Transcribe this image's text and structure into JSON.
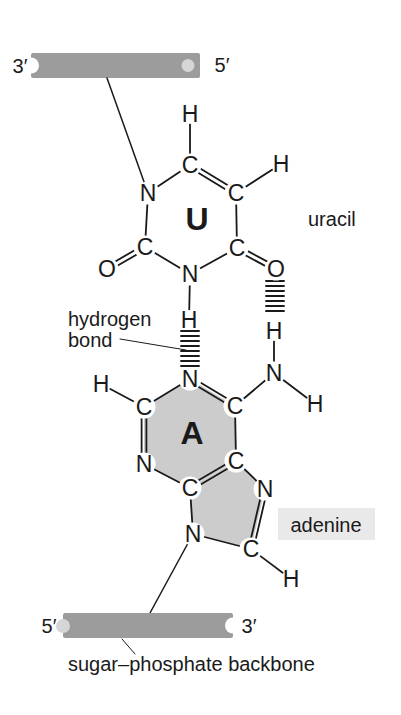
{
  "colors": {
    "line": "#1a1a1a",
    "text": "#1a1a1a",
    "backbone": "#9c9c9c",
    "backbone_socket": "#d6d6d6",
    "ring_fill": "#cccccc",
    "label_bg": "#e9e9e9"
  },
  "backbones": {
    "top": {
      "left_end": "3′",
      "right_end": "5′"
    },
    "bottom": {
      "left_end": "5′",
      "right_end": "3′"
    },
    "caption": "sugar–phosphate backbone"
  },
  "annotations": {
    "uracil_label": "uracil",
    "adenine_label": "adenine",
    "hbond_label_line1": "hydrogen",
    "hbond_label_line2": "bond"
  },
  "molecule": {
    "atoms": [
      {
        "id": "u-h5",
        "el": "H",
        "x": 190,
        "y": 114
      },
      {
        "id": "u-c5",
        "el": "C",
        "x": 190,
        "y": 165
      },
      {
        "id": "u-h6",
        "el": "H",
        "x": 281,
        "y": 164
      },
      {
        "id": "u-c6",
        "el": "C",
        "x": 236,
        "y": 193
      },
      {
        "id": "u-n1",
        "el": "N",
        "x": 148,
        "y": 193
      },
      {
        "id": "u-c2",
        "el": "C",
        "x": 145,
        "y": 247
      },
      {
        "id": "u-o2",
        "el": "O",
        "x": 107,
        "y": 269
      },
      {
        "id": "u-n3",
        "el": "N",
        "x": 190,
        "y": 274
      },
      {
        "id": "u-c4",
        "el": "C",
        "x": 237,
        "y": 248
      },
      {
        "id": "u-o4",
        "el": "O",
        "x": 276,
        "y": 269
      },
      {
        "id": "u-h3",
        "el": "H",
        "x": 189,
        "y": 320
      },
      {
        "id": "a-ha",
        "el": "H",
        "x": 274,
        "y": 331
      },
      {
        "id": "a-n6",
        "el": "N",
        "x": 274,
        "y": 373
      },
      {
        "id": "a-hb",
        "el": "H",
        "x": 315,
        "y": 404
      },
      {
        "id": "a-n1",
        "el": "N",
        "x": 190,
        "y": 379
      },
      {
        "id": "a-h2",
        "el": "H",
        "x": 101,
        "y": 384
      },
      {
        "id": "a-c2",
        "el": "C",
        "x": 144,
        "y": 407
      },
      {
        "id": "a-c6",
        "el": "C",
        "x": 235,
        "y": 406
      },
      {
        "id": "a-n3",
        "el": "N",
        "x": 144,
        "y": 464
      },
      {
        "id": "a-c5",
        "el": "C",
        "x": 236,
        "y": 461
      },
      {
        "id": "a-c4",
        "el": "C",
        "x": 190,
        "y": 488
      },
      {
        "id": "a-n7",
        "el": "N",
        "x": 265,
        "y": 489
      },
      {
        "id": "a-n9",
        "el": "N",
        "x": 193,
        "y": 534
      },
      {
        "id": "a-c8",
        "el": "C",
        "x": 251,
        "y": 549
      },
      {
        "id": "a-h8",
        "el": "H",
        "x": 291,
        "y": 579
      }
    ],
    "bonds": [
      [
        "u-c5",
        "u-h5",
        "s"
      ],
      [
        "u-n1",
        "u-c5",
        "s"
      ],
      [
        "u-c5",
        "u-c6",
        "d"
      ],
      [
        "u-c6",
        "u-h6",
        "s"
      ],
      [
        "u-c6",
        "u-c4",
        "s"
      ],
      [
        "u-c4",
        "u-n3",
        "s"
      ],
      [
        "u-n3",
        "u-c2",
        "s"
      ],
      [
        "u-c2",
        "u-n1",
        "s"
      ],
      [
        "u-c2",
        "u-o2",
        "d"
      ],
      [
        "u-c4",
        "u-o4",
        "d"
      ],
      [
        "u-n3",
        "u-h3",
        "s"
      ],
      [
        "a-ha",
        "a-n6",
        "s"
      ],
      [
        "a-n6",
        "a-hb",
        "s"
      ],
      [
        "a-n6",
        "a-c6",
        "s"
      ],
      [
        "a-n1",
        "a-c6",
        "d"
      ],
      [
        "a-n1",
        "a-c2",
        "s"
      ],
      [
        "a-c2",
        "a-h2",
        "s"
      ],
      [
        "a-c2",
        "a-n3",
        "d"
      ],
      [
        "a-c6",
        "a-c5",
        "s"
      ],
      [
        "a-n3",
        "a-c4",
        "s"
      ],
      [
        "a-c4",
        "a-c5",
        "d"
      ],
      [
        "a-c5",
        "a-n7",
        "s"
      ],
      [
        "a-n7",
        "a-c8",
        "d"
      ],
      [
        "a-c8",
        "a-n9",
        "s"
      ],
      [
        "a-n9",
        "a-c4",
        "s"
      ],
      [
        "a-c8",
        "a-h8",
        "s"
      ]
    ],
    "ring_fills": [
      {
        "name": "adenine-hexagon-shading",
        "atoms": [
          "a-n1",
          "a-c6",
          "a-c5",
          "a-c4",
          "a-n3",
          "a-c2"
        ]
      },
      {
        "name": "adenine-pentagon-shading",
        "atoms": [
          "a-c5",
          "a-n7",
          "a-c8",
          "a-n9",
          "a-c4"
        ]
      }
    ],
    "ring_letters": [
      {
        "text": "U",
        "x": 197,
        "y": 219
      },
      {
        "text": "A",
        "x": 192,
        "y": 433
      }
    ],
    "hydrogen_bonds": [
      {
        "x": 190,
        "y_start": 331,
        "y_end": 366,
        "spacing": 5,
        "width": 18
      },
      {
        "x": 275,
        "y_start": 281,
        "y_end": 311,
        "spacing": 5,
        "width": 18
      }
    ],
    "connectors": [
      {
        "name": "uracil-to-top-backbone-connector",
        "x1": 107,
        "y1": 78,
        "x2": 148,
        "y2": 193
      },
      {
        "name": "adenine-to-bottom-backbone-connector",
        "x1": 193,
        "y1": 534,
        "x2": 150,
        "y2": 613
      }
    ],
    "pointers": [
      {
        "name": "hbond-label-pointer",
        "x1": 120,
        "y1": 339,
        "x2": 186,
        "y2": 350
      },
      {
        "name": "backbone-caption-pointer",
        "x1": 122,
        "y1": 639,
        "x2": 135,
        "y2": 654
      }
    ]
  }
}
